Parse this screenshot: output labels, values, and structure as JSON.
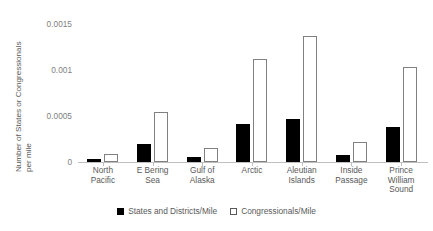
{
  "chart_data": {
    "type": "bar",
    "title": "",
    "xlabel": "",
    "ylabel": "Number of States or Congressionals\nper mile",
    "ylim": [
      0,
      0.0015
    ],
    "yticks": [
      "0",
      "0.0005",
      "0.001",
      "0.0015"
    ],
    "ytick_values": [
      0,
      0.0005,
      0.001,
      0.0015
    ],
    "grid": false,
    "legend_position": "bottom",
    "categories": [
      "North\nPacific",
      "E Bering\nSea",
      "Gulf of\nAlaska",
      "Arctic",
      "Aleutian\nIslands",
      "Inside\nPassage",
      "Prince\nWilliam\nSound"
    ],
    "series": [
      {
        "name": "States and Districts/Mile",
        "color": "#000000",
        "style": "filled",
        "values": [
          3e-05,
          0.000195,
          5e-05,
          0.00041,
          0.00047,
          8e-05,
          0.00038
        ]
      },
      {
        "name": "Congressionals/Mile",
        "color": "#ffffff",
        "style": "outlined",
        "values": [
          9e-05,
          0.00054,
          0.000155,
          0.00112,
          0.00137,
          0.00022,
          0.00103
        ]
      }
    ]
  },
  "legend": {
    "items": [
      {
        "label": "States and Districts/Mile",
        "swatch": "dark"
      },
      {
        "label": "Congressionals/Mile",
        "swatch": "light"
      }
    ]
  }
}
